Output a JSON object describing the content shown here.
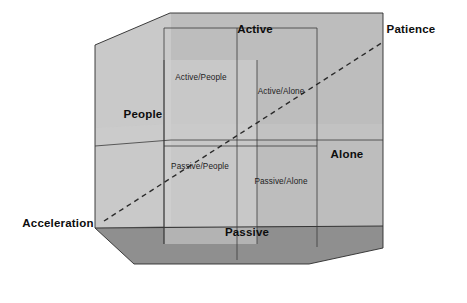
{
  "diagram": {
    "type": "3d-cube-quadrant-model",
    "axes": [
      {
        "id": "active",
        "label": "Active",
        "position": "top",
        "style": "bold"
      },
      {
        "id": "passive",
        "label": "Passive",
        "position": "bottom",
        "style": "bold"
      },
      {
        "id": "people",
        "label": "People",
        "position": "left",
        "style": "bold"
      },
      {
        "id": "alone",
        "label": "Alone",
        "position": "right",
        "style": "bold"
      },
      {
        "id": "patience",
        "label": "Patience",
        "position": "top-right",
        "style": "bold"
      },
      {
        "id": "acceleration",
        "label": "Acceleration",
        "position": "bottom-left",
        "style": "bold"
      }
    ],
    "quadrants": [
      {
        "id": "active-people",
        "label": "Active/People",
        "position": "upper-left"
      },
      {
        "id": "active-alone",
        "label": "Active/Alone",
        "position": "upper-right"
      },
      {
        "id": "passive-people",
        "label": "Passive/People",
        "position": "lower-left"
      },
      {
        "id": "passive-alone",
        "label": "Passive/Alone",
        "position": "lower-right"
      }
    ],
    "diagonal": {
      "id": "acceleration-patience-axis",
      "from": "Acceleration",
      "to": "Patience",
      "style": "dashed"
    },
    "colors": {
      "background": "#ffffff",
      "top_face": "#c2c2c2",
      "left_face": "#c9c9c9",
      "back_face": "#bdbdbd",
      "inner_panel": "#cfcfcf",
      "inner_panel_light": "#d6d6d6",
      "floor": "#8f8f8f",
      "edge": "#2b2b2b",
      "text": "#0d0d0d"
    }
  }
}
